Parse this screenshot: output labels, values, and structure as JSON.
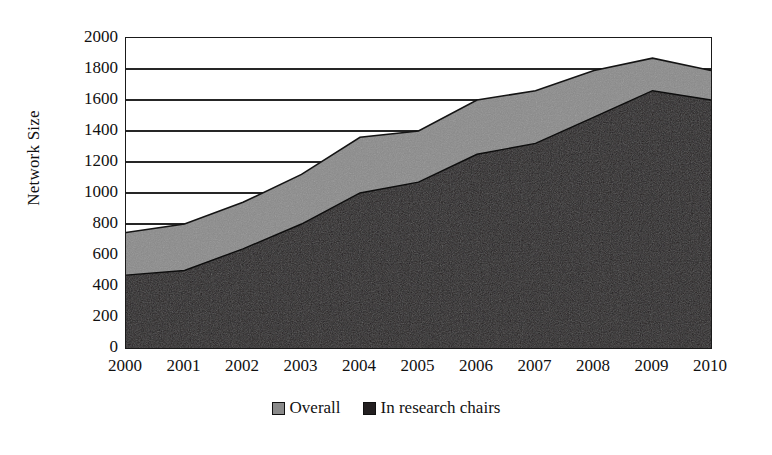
{
  "chart_data": {
    "type": "area",
    "title": "",
    "subtitle": "",
    "xlabel": "",
    "ylabel": "Network Size",
    "categories": [
      "2000",
      "2001",
      "2002",
      "2003",
      "2004",
      "2005",
      "2006",
      "2007",
      "2008",
      "2009",
      "2010"
    ],
    "x": [
      2000,
      2001,
      2002,
      2003,
      2004,
      2005,
      2006,
      2007,
      2008,
      2009,
      2010
    ],
    "series": [
      {
        "name": "Overall",
        "color": "#8a8a8a",
        "values": [
          745,
          800,
          940,
          1120,
          1360,
          1400,
          1600,
          1660,
          1790,
          1870,
          1790
        ]
      },
      {
        "name": "In research chairs",
        "color": "#231f20",
        "values": [
          470,
          500,
          640,
          800,
          1000,
          1070,
          1250,
          1320,
          1490,
          1660,
          1600
        ]
      }
    ],
    "ylim": [
      0,
      2000
    ],
    "ytick_values": [
      0,
      200,
      400,
      600,
      800,
      1000,
      1200,
      1400,
      1600,
      1800,
      2000
    ],
    "ytick_labels": [
      "0",
      "200",
      "400",
      "600",
      "800",
      "1000",
      "1200",
      "1400",
      "1600",
      "1800",
      "2000"
    ],
    "xlim": [
      2000,
      2010
    ],
    "grid": true,
    "grid_axis": "y",
    "legend_position": "bottom-center",
    "stacked": false,
    "overlay_order": [
      "Overall",
      "In research chairs"
    ]
  },
  "axis": {
    "y_title": "Network Size"
  },
  "legend": {
    "items": [
      {
        "label": "Overall",
        "color": "#8a8a8a"
      },
      {
        "label": "In research chairs",
        "color": "#231f20"
      }
    ]
  },
  "colors": {
    "overall": "#8a8a8a",
    "research_chairs": "#231f20",
    "axis": "#1a1a1a",
    "grid": "#262626",
    "background": "#ffffff"
  }
}
